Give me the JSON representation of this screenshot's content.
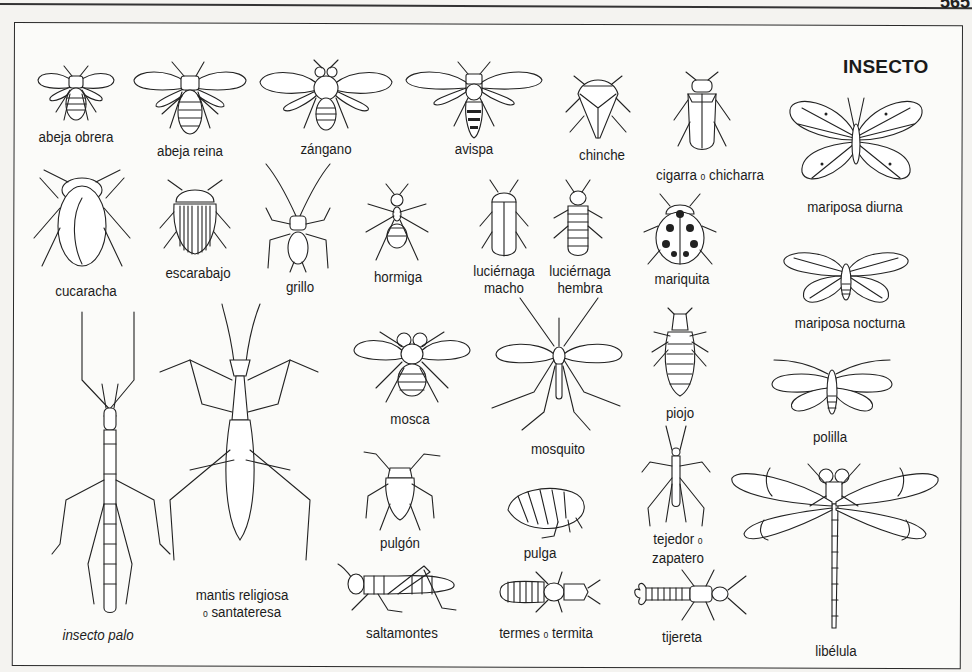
{
  "page": {
    "number": "565",
    "title": "INSECTO"
  },
  "labels": {
    "abeja_obrera": "abeja obrera",
    "abeja_reina": "abeja reina",
    "zangano": "zángano",
    "avispa": "avispa",
    "chinche": "chinche",
    "cigarra": "cigarra",
    "cigarra_conj": "o",
    "chicharra": "chicharra",
    "mariposa_diurna": "mariposa diurna",
    "cucaracha": "cucaracha",
    "escarabajo": "escarabajo",
    "grillo": "grillo",
    "hormiga": "hormiga",
    "luciernaga_macho_1": "luciérnaga",
    "luciernaga_macho_2": "macho",
    "luciernaga_hembra_1": "luciérnaga",
    "luciernaga_hembra_2": "hembra",
    "mariquita": "mariquita",
    "mariposa_nocturna": "mariposa nocturna",
    "mosca": "mosca",
    "mosquito": "mosquito",
    "piojo": "piojo",
    "polilla": "polilla",
    "pulgon": "pulgón",
    "pulga": "pulga",
    "tejedor": "tejedor",
    "tejedor_conj": "o",
    "zapatero": "zapatero",
    "libelula": "libélula",
    "mantis_1": "mantis religiosa",
    "mantis_conj": "o",
    "mantis_2": "santateresa",
    "insecto_palo": "insecto palo",
    "saltamontes": "saltamontes",
    "termes": "termes",
    "termes_conj": "o",
    "termita": "termita",
    "tijereta": "tijereta"
  },
  "colors": {
    "ink": "#1a1a1a",
    "paper": "#fbfbf9",
    "frame": "#2a2a2a"
  }
}
